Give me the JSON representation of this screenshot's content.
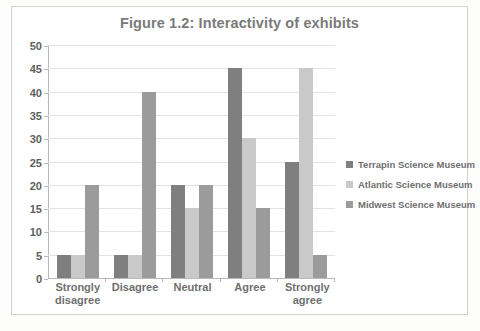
{
  "chart_data": {
    "type": "bar",
    "title": "Figure 1.2: Interactivity of exhibits",
    "xlabel": "",
    "ylabel": "",
    "ylim": [
      0,
      50
    ],
    "ytick_step": 5,
    "yticks": [
      50,
      45,
      40,
      35,
      30,
      25,
      20,
      15,
      10,
      5,
      0
    ],
    "categories": [
      "Strongly disagree",
      "Disagree",
      "Neutral",
      "Agree",
      "Strongly agree"
    ],
    "grid": true,
    "legend_position": "right",
    "series": [
      {
        "name": "Terrapin Science Museum",
        "color": "#7f7f7f",
        "values": [
          5,
          5,
          20,
          45,
          25
        ]
      },
      {
        "name": "Atlantic Science Museum",
        "color": "#c9c9c9",
        "values": [
          5,
          5,
          15,
          30,
          45
        ]
      },
      {
        "name": "Midwest Science Museum",
        "color": "#9b9b9b",
        "values": [
          20,
          40,
          20,
          15,
          5
        ]
      }
    ]
  },
  "colors": {
    "frame_border": "#d2d2d2",
    "axis": "#b9b9b9",
    "gridline": "#e3e3e3",
    "text": "#6f6f6f",
    "title_text": "#7a7a7a",
    "background": "#ffffff"
  }
}
